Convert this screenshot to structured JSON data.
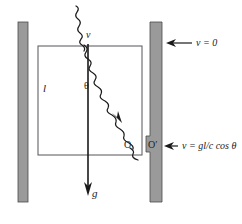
{
  "figure": {
    "type": "physics-diagram",
    "background_color": "#ffffff",
    "wall_color": "#9a9a9a",
    "line_color": "#1a1a1a"
  },
  "labels": {
    "source_velocity": "v",
    "box_height": "l",
    "angle": "θ",
    "origin": "O",
    "origin_prime": "O′",
    "gravity": "g",
    "wall_top_velocity": "v = 0",
    "wall_bottom_velocity_prefix": "v = g",
    "wall_bottom_velocity_l": "l",
    "wall_bottom_velocity_slash": "/",
    "wall_bottom_velocity_c": "c",
    "wall_bottom_velocity_cos": "cos",
    "wall_bottom_velocity_theta": "θ",
    "wall_bottom_velocity_full": "v = gl/c cos θ"
  },
  "geometry": {
    "left_wall": {
      "x": 18,
      "y": 22,
      "width": 10,
      "height": 180
    },
    "right_wall": {
      "x": 150,
      "y": 22,
      "width": 12,
      "height": 180
    },
    "notch": {
      "x": 146,
      "y": 136,
      "width": 12,
      "height": 16
    },
    "box": {
      "x": 38,
      "y": 46,
      "width": 104,
      "height": 109
    },
    "vertical_arrow": {
      "x": 88,
      "y_start": 46,
      "y_end": 192
    },
    "wavy_ray_angle_deg": 20
  }
}
